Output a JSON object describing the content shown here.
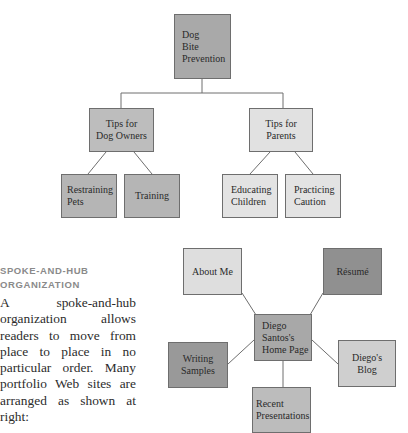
{
  "tree_diagram": {
    "root": {
      "label": "Dog\nBite\nPrevention",
      "color": "#a9a9a9"
    },
    "branches": [
      {
        "label": "Tips for\nDog Owners",
        "color": "#bdbdbd",
        "children": [
          {
            "label": "Restraining\nPets",
            "color": "#b5b5b5"
          },
          {
            "label": "Training",
            "color": "#b5b5b5"
          }
        ]
      },
      {
        "label": "Tips for\nParents",
        "color": "#e1e1e1",
        "children": [
          {
            "label": "Educating\nChildren",
            "color": "#e3e3e3"
          },
          {
            "label": "Practicing\nCaution",
            "color": "#e3e3e3"
          }
        ]
      }
    ]
  },
  "sidebar": {
    "heading": "SPOKE-AND-HUB\nORGANIZATION",
    "body": "A spoke-and-hub organization allows readers to move from place to place in no particular order. Many portfolio Web sites are arranged as shown at right:"
  },
  "hub_diagram": {
    "hub": {
      "label": "Diego\nSantos's\nHome Page",
      "color": "#a8a8a8"
    },
    "spokes": [
      {
        "label": "About Me",
        "color": "#dedede"
      },
      {
        "label": "Résumé",
        "color": "#909090"
      },
      {
        "label": "Writing\nSamples",
        "color": "#999999"
      },
      {
        "label": "Diego's\nBlog",
        "color": "#cfcfcf"
      },
      {
        "label": "Recent\nPresentations",
        "color": "#bcbcbc"
      }
    ]
  }
}
